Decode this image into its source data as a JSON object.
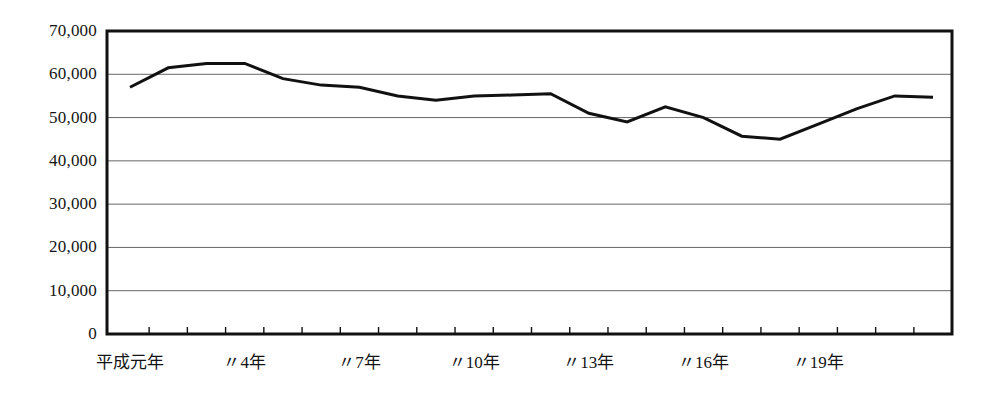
{
  "chart_data": {
    "type": "line",
    "title": "",
    "subtitle": "",
    "xlabel": "",
    "ylabel": "",
    "grid": true,
    "legend": null,
    "ylim": [
      0,
      70000
    ],
    "ytick_labels": [
      "70,000",
      "60,000",
      "50,000",
      "40,000",
      "30,000",
      "20,000",
      "10,000",
      "0"
    ],
    "ytick_values": [
      70000,
      60000,
      50000,
      40000,
      30000,
      20000,
      10000,
      0
    ],
    "xtick_labels": [
      "平成元年",
      "〃4年",
      "〃7年",
      "〃10年",
      "〃13年",
      "〃16年",
      "〃19年"
    ],
    "xtick_label_indices": [
      0,
      3,
      6,
      9,
      12,
      15,
      18
    ],
    "categories": [
      "平成元年",
      "平成2年",
      "平成3年",
      "平成4年",
      "平成5年",
      "平成6年",
      "平成7年",
      "平成8年",
      "平成9年",
      "平成10年",
      "平成11年",
      "平成12年",
      "平成13年",
      "平成14年",
      "平成15年",
      "平成16年",
      "平成17年",
      "平成18年",
      "平成19年"
    ],
    "values": [
      57000,
      61500,
      62500,
      62500,
      59000,
      57500,
      57000,
      55000,
      54000,
      55000,
      55200,
      55500,
      51000,
      49000,
      52500,
      50000,
      45700,
      45000,
      48500
    ],
    "values_tail": [
      52000,
      55000,
      54700
    ],
    "line_color": "#111111",
    "line_width": 3,
    "grid_color": "#666666",
    "axis_color": "#111111",
    "background_color": "#ffffff"
  },
  "axes": {
    "plot_left_px": 107,
    "plot_right_px": 952,
    "plot_top_px": 31,
    "plot_bottom_px": 334
  }
}
